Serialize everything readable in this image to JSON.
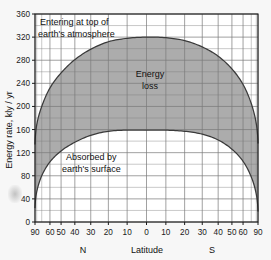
{
  "chart_data": {
    "type": "area",
    "title": "",
    "subtitle": "",
    "xlabel": "Latitude",
    "ylabel": "Energy rate, kly / yr",
    "ylim": [
      0,
      360
    ],
    "ytick_labels": [
      "0",
      "40",
      "80",
      "120",
      "160",
      "200",
      "240",
      "280",
      "320",
      "360"
    ],
    "ytick_values": [
      0,
      40,
      80,
      120,
      160,
      200,
      240,
      280,
      320,
      360
    ],
    "yminor_step": 20,
    "grid": true,
    "legend_position": "none",
    "x_axis_note": "sine-of-latitude scale, 90N at left to 90S at right",
    "xtick_labels": [
      "90",
      "60",
      "50",
      "40",
      "30",
      "20",
      "10",
      "0",
      "10",
      "20",
      "30",
      "40",
      "50",
      "60",
      "90"
    ],
    "xtick_latitudes": [
      -90,
      -60,
      -50,
      -40,
      -30,
      -20,
      -10,
      0,
      10,
      20,
      30,
      40,
      50,
      60,
      90
    ],
    "hemisphere_left_label": "N",
    "hemisphere_right_label": "S",
    "series": [
      {
        "name": "Entering at top of earth's atmosphere",
        "latitudes": [
          -90,
          -80,
          -70,
          -60,
          -50,
          -40,
          -30,
          -20,
          -10,
          0,
          10,
          20,
          30,
          40,
          50,
          60,
          70,
          80,
          90
        ],
        "values": [
          134,
          168,
          200,
          232,
          258,
          281,
          299,
          312,
          318,
          320,
          319,
          314,
          303,
          287,
          265,
          238,
          205,
          170,
          136
        ]
      },
      {
        "name": "Absorbed by earth's surface",
        "latitudes": [
          -90,
          -80,
          -70,
          -60,
          -50,
          -40,
          -30,
          -20,
          -10,
          0,
          10,
          20,
          30,
          40,
          50,
          60,
          70,
          80,
          90
        ],
        "values": [
          24,
          52,
          80,
          104,
          123,
          138,
          150,
          157,
          159,
          159,
          159,
          157,
          152,
          142,
          126,
          105,
          78,
          48,
          18
        ]
      }
    ],
    "band_label": "Energy loss",
    "annotations": [
      {
        "id": "top-curve-label",
        "line1": "Entering at top of",
        "line2": "earth's atmosphere"
      },
      {
        "id": "band-label",
        "line1": "Energy",
        "line2": "loss"
      },
      {
        "id": "bottom-curve-label",
        "line1": "Absorbed by",
        "line2": "earth's surface"
      }
    ],
    "colors": {
      "band_fill": "#a8a8a8",
      "outside_fill": "#ffffff",
      "figure_background": "#f5f5f5",
      "grid": "#7a7a7a",
      "axis": "#1a1a1a",
      "curve": "#3a3a3a",
      "text": "#111111"
    }
  }
}
